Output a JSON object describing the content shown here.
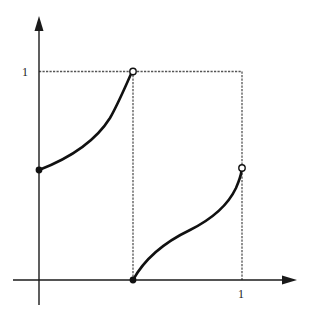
{
  "diagram": {
    "type": "piecewise-function-graph",
    "colors": {
      "background": "#ffffff",
      "axis": "#1a1a1a",
      "curve": "#111111",
      "guide": "#555555"
    },
    "axes": {
      "y_tick_label": "1",
      "x_tick_label": "1"
    },
    "pieces": [
      {
        "name": "left-branch",
        "start": {
          "x": 0,
          "y": 0.5,
          "marker": "closed"
        },
        "end": {
          "x": 0.5,
          "y": 1,
          "marker": "open"
        },
        "shape": "increasing, convex"
      },
      {
        "name": "right-branch",
        "start": {
          "x": 0.5,
          "y": 0,
          "marker": "closed"
        },
        "end": {
          "x": 1,
          "y": 0.5,
          "marker": "open"
        },
        "shape": "increasing, S-shaped"
      }
    ],
    "guides": {
      "horizontal_at_y": 1,
      "vertical_at_x": [
        0.5,
        1
      ]
    }
  }
}
